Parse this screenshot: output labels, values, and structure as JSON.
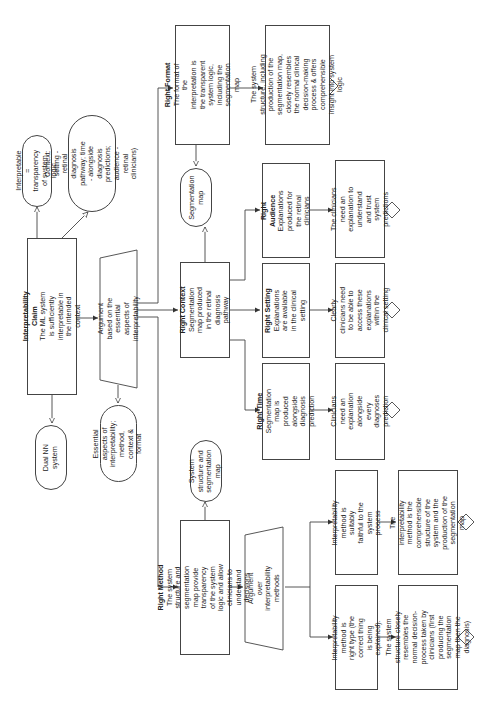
{
  "diagram": {
    "claim": {
      "title": "Interpretability Claim",
      "text": "The ML system is sufficiently interpretable in the intended context"
    },
    "claim_contexts": {
      "interpretable_def": "Interpretable = transparency of system logic",
      "context_def": "Context: setting - retinal diagnosis pathway; time - alongside diagnosis predictions; audience - retinal clinicians)",
      "system": "Dual NN system"
    },
    "argument_essential": {
      "text": "Argument based on the essential aspects of interpretability",
      "context": "Essential aspects of interpretability; method, context & format"
    },
    "right_format": {
      "title": "Right Format",
      "text": "The format of the interpretation is the transparent system logic, including the segmentation map",
      "context": "Segmentation map",
      "solution": "The system structure, including production of the segmentation map, closely resembles the normal clinical decision-making process & offers comprehensible insight into system logic"
    },
    "right_context": {
      "title": "Right  Context",
      "text": "Segmentation map produced in the retinal diagnosis pathway"
    },
    "right_audience": {
      "title": "Right Audience",
      "text": "Explanations produced for the retinal clinicians",
      "solution": "The clinicians need an explanation to understand and trust system predictions"
    },
    "right_setting": {
      "title": "Right Setting",
      "text": "Explanations are available in the clinical setting",
      "solution": "Clearly clinicians need to be able to access these explanations within the clinical setting"
    },
    "right_time": {
      "title": "Right Time",
      "text": "Segmentation map is produced alongside diagnosis prediction",
      "solution": "Clinicians need an explanation alongside every diagnoses prediction"
    },
    "right_method": {
      "title": "Right Method",
      "text": "The system structure and segmentation map provide transparency of the system logic and allow clinicians to understand decisions",
      "context": "System structure and segmentation map"
    },
    "argument_methods": {
      "text": "Argument over interpretability methods"
    },
    "faithful": {
      "text": "Interpretability method is suitably faithful to the system process",
      "solution": "The interpretability method is the comprehensible structure of the system and the production of the segmentation map"
    },
    "right_type": {
      "text": "Interpretability method is right type (the correct thing is being explained).",
      "solution": "The system structure closely resembles the normal decision-process taken by clinicians (first producing the segmentation map then the diagnosis)"
    }
  },
  "colors": {
    "line": "#444444",
    "fill": "#ffffff",
    "text": "#222222"
  }
}
